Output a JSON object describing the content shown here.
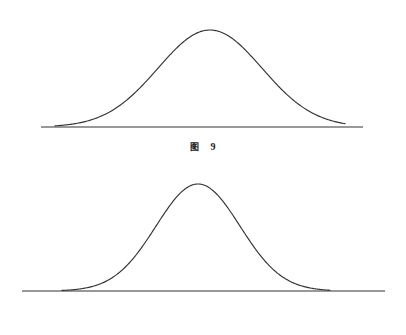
{
  "document": {
    "background_color": "#ffffff",
    "stroke_color": "#333333",
    "text_color": "#1a1a1a"
  },
  "figures": [
    {
      "id": "figure-9",
      "caption_label": "图",
      "caption_number": "9",
      "caption_text": "图 9"
    },
    {
      "id": "figure-10",
      "caption_label": "图",
      "caption_number": "10",
      "caption_text": "图 10"
    }
  ],
  "chart_data": [
    {
      "type": "line",
      "title": "图 9",
      "subtitle": "",
      "xlabel": "",
      "ylabel": "",
      "legend": [],
      "grid": false,
      "axis": {
        "baseline_only": true,
        "baseline_x_start": 41,
        "baseline_x_end": 363,
        "baseline_y": 127,
        "ticks": [],
        "tick_labels": []
      },
      "curve": {
        "shape": "gaussian",
        "center_x": 210,
        "peak_y": 30,
        "amplitude": 97,
        "sigma": 52,
        "visible_x_start": 55,
        "visible_x_end": 345,
        "relative_width": "wide",
        "relative_height": "lower"
      },
      "x": [
        55,
        80,
        105,
        130,
        155,
        180,
        210,
        240,
        265,
        290,
        315,
        345
      ],
      "values": [
        0.02,
        0.06,
        0.16,
        0.34,
        0.61,
        0.87,
        1.0,
        0.87,
        0.61,
        0.34,
        0.16,
        0.03
      ]
    },
    {
      "type": "line",
      "title": "图 10",
      "subtitle": "",
      "xlabel": "",
      "ylabel": "",
      "legend": [],
      "grid": false,
      "axis": {
        "baseline_only": true,
        "baseline_x_start": 22,
        "baseline_x_end": 385,
        "baseline_y": 291,
        "ticks": [],
        "tick_labels": []
      },
      "curve": {
        "shape": "gaussian",
        "center_x": 198,
        "peak_y": 184,
        "amplitude": 107,
        "sigma": 42,
        "visible_x_start": 62,
        "visible_x_end": 330,
        "relative_width": "narrow",
        "relative_height": "higher"
      },
      "x": [
        62,
        82,
        102,
        122,
        142,
        168,
        198,
        228,
        252,
        275,
        300,
        330
      ],
      "values": [
        0.02,
        0.06,
        0.15,
        0.32,
        0.58,
        0.88,
        1.0,
        0.88,
        0.64,
        0.37,
        0.15,
        0.02
      ]
    }
  ]
}
